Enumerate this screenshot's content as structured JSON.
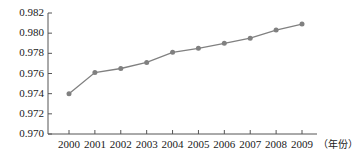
{
  "chart_data": {
    "type": "line",
    "title": "",
    "subtitle": "",
    "xlabel": "（年份）",
    "ylabel": "",
    "categories": [
      "2000",
      "2001",
      "2002",
      "2003",
      "2004",
      "2005",
      "2006",
      "2007",
      "2008",
      "2009"
    ],
    "values": [
      0.974,
      0.9761,
      0.9765,
      0.9771,
      0.9781,
      0.9785,
      0.979,
      0.9795,
      0.9803,
      0.9809
    ],
    "series": [
      {
        "name": "",
        "values": [
          0.974,
          0.9761,
          0.9765,
          0.9771,
          0.9781,
          0.9785,
          0.979,
          0.9795,
          0.9803,
          0.9809
        ]
      }
    ],
    "ylim": [
      0.97,
      0.982
    ],
    "ytick_labels": [
      "0.982",
      "0.980",
      "0.978",
      "0.976",
      "0.974",
      "0.972",
      "0.970"
    ],
    "ytick_values": [
      0.982,
      0.98,
      0.978,
      0.976,
      0.974,
      0.972,
      0.97
    ],
    "xtick_labels": [
      "2000",
      "2001",
      "2002",
      "2003",
      "2004",
      "2005",
      "2006",
      "2007",
      "2008",
      "2009"
    ],
    "grid": false,
    "legend": "none",
    "line_color": "#808080",
    "marker_color": "#808080",
    "marker_shape": "circle",
    "axis_color": "#555555"
  },
  "axis": {
    "x_title": "（年份）"
  }
}
